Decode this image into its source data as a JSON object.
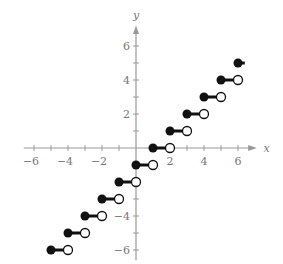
{
  "chart_data": {
    "type": "scatter",
    "title": "",
    "function": "y = floor(x) - 1",
    "xlabel": "x",
    "ylabel": "y",
    "xlim": [
      -6.5,
      7
    ],
    "ylim": [
      -6.5,
      7
    ],
    "x_tick_labels": [
      "-6",
      "-4",
      "-2",
      "2",
      "4",
      "6"
    ],
    "y_tick_labels": [
      "6",
      "4",
      "2",
      "-4",
      "-6"
    ],
    "grid": false,
    "steps": [
      {
        "x_start": -5,
        "x_end": -4,
        "y": -6
      },
      {
        "x_start": -4,
        "x_end": -3,
        "y": -5
      },
      {
        "x_start": -3,
        "x_end": -2,
        "y": -4
      },
      {
        "x_start": -2,
        "x_end": -1,
        "y": -3
      },
      {
        "x_start": -1,
        "x_end": 0,
        "y": -2
      },
      {
        "x_start": 0,
        "x_end": 1,
        "y": -1
      },
      {
        "x_start": 1,
        "x_end": 2,
        "y": 0
      },
      {
        "x_start": 2,
        "x_end": 3,
        "y": 1
      },
      {
        "x_start": 3,
        "x_end": 4,
        "y": 2
      },
      {
        "x_start": 4,
        "x_end": 5,
        "y": 3
      },
      {
        "x_start": 5,
        "x_end": 6,
        "y": 4
      },
      {
        "x_start": 6,
        "x_end": 6.4,
        "y": 5
      }
    ],
    "endpoint_style": {
      "left": "closed",
      "right": "open"
    }
  },
  "layout": {
    "origin_px": [
      136,
      148
    ],
    "unit_px": 17,
    "axis_color": "#999999",
    "point_color": "#111111"
  }
}
